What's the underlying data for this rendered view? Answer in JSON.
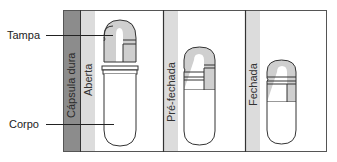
{
  "figure": {
    "title": "Cápsula dura",
    "colors": {
      "frame": "#4a4a4a",
      "dark_strip": "#8c8c8c",
      "light_strip": "#d9d9d9",
      "shell_fill": "#cfcfcf",
      "background": "#ffffff"
    },
    "callouts": [
      {
        "id": "cap",
        "label": "Tampa"
      },
      {
        "id": "body",
        "label": "Corpo"
      }
    ],
    "panels": [
      {
        "id": "open",
        "label": "Aberta"
      },
      {
        "id": "pre-closed",
        "label": "Pré-fechada"
      },
      {
        "id": "closed",
        "label": "Fechada"
      }
    ]
  }
}
